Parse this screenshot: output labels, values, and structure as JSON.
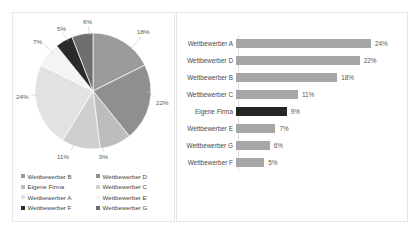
{
  "chart_data": [
    {
      "type": "pie",
      "title": "",
      "categories": [
        "Wettbewerber B",
        "Wettbewerber D",
        "Eigene Firma",
        "Wettbewerber C",
        "Wettbewerber A",
        "Wettbewerber E",
        "Wettbewerber F",
        "Wettbewerber G"
      ],
      "values": [
        18,
        22,
        9,
        11,
        24,
        7,
        5,
        6
      ],
      "labels": [
        "18%",
        "22%",
        "9%",
        "11%",
        "24%",
        "7%",
        "5%",
        "6%"
      ],
      "colors": [
        "#9b9b9b",
        "#8f8f8f",
        "#bdbdbd",
        "#cfcfcf",
        "#e2e2e2",
        "#f4f4f4",
        "#2b2b2b",
        "#6e6e6e"
      ],
      "legend_position": "bottom",
      "legend_columns": 2,
      "legend_order": [
        "Wettbewerber B",
        "Wettbewerber D",
        "Eigene Firma",
        "Wettbewerber C",
        "Wettbewerber A",
        "Wettbewerber E",
        "Wettbewerber F",
        "Wettbewerber G"
      ]
    },
    {
      "type": "bar",
      "orientation": "horizontal",
      "title": "",
      "xlabel": "",
      "ylabel": "",
      "xlim": [
        0,
        24
      ],
      "grid": false,
      "categories": [
        "Wettbewerber A",
        "Wettbewerber D",
        "Wettbewerber B",
        "Wettbewerber C",
        "Eigene Firma",
        "Wettbewerber E",
        "Wettbewerber G",
        "Wettbewerber F"
      ],
      "values": [
        24,
        22,
        18,
        11,
        9,
        7,
        6,
        5
      ],
      "labels": [
        "24%",
        "22%",
        "18%",
        "11%",
        "9%",
        "7%",
        "6%",
        "5%"
      ],
      "highlight_category": "Eigene Firma",
      "bar_color": "#a6a6a6",
      "highlight_color": "#262626"
    }
  ],
  "pie": {
    "slices": [
      {
        "name": "Wettbewerber B",
        "label": "18%",
        "value": 18,
        "color": "#9b9b9b"
      },
      {
        "name": "Wettbewerber D",
        "label": "22%",
        "value": 22,
        "color": "#8f8f8f"
      },
      {
        "name": "Eigene Firma",
        "label": "9%",
        "value": 9,
        "color": "#bdbdbd"
      },
      {
        "name": "Wettbewerber C",
        "label": "11%",
        "value": 11,
        "color": "#cfcfcf"
      },
      {
        "name": "Wettbewerber A",
        "label": "24%",
        "value": 24,
        "color": "#e2e2e2"
      },
      {
        "name": "Wettbewerber E",
        "label": "7%",
        "value": 7,
        "color": "#f4f4f4"
      },
      {
        "name": "Wettbewerber F",
        "label": "5%",
        "value": 5,
        "color": "#2b2b2b"
      },
      {
        "name": "Wettbewerber G",
        "label": "6%",
        "value": 6,
        "color": "#6e6e6e"
      }
    ],
    "legend": [
      {
        "label": "Wettbewerber B",
        "color": "#9b9b9b"
      },
      {
        "label": "Wettbewerber D",
        "color": "#8f8f8f"
      },
      {
        "label": "Eigene Firma",
        "color": "#bdbdbd"
      },
      {
        "label": "Wettbewerber C",
        "color": "#cfcfcf"
      },
      {
        "label": "Wettbewerber A",
        "color": "#e2e2e2"
      },
      {
        "label": "Wettbewerber E",
        "color": "#f4f4f4"
      },
      {
        "label": "Wettbewerber F",
        "color": "#2b2b2b"
      },
      {
        "label": "Wettbewerber G",
        "color": "#6e6e6e"
      }
    ]
  },
  "bars": {
    "rows": [
      {
        "category": "Wettbewerber A",
        "value": 24,
        "label": "24%",
        "highlight": false
      },
      {
        "category": "Wettbewerber D",
        "value": 22,
        "label": "22%",
        "highlight": false
      },
      {
        "category": "Wettbewerber B",
        "value": 18,
        "label": "18%",
        "highlight": false
      },
      {
        "category": "Wettbewerber C",
        "value": 11,
        "label": "11%",
        "highlight": false
      },
      {
        "category": "Eigene Firma",
        "value": 9,
        "label": "9%",
        "highlight": true
      },
      {
        "category": "Wettbewerber E",
        "value": 7,
        "label": "7%",
        "highlight": false
      },
      {
        "category": "Wettbewerber G",
        "value": 6,
        "label": "6%",
        "highlight": false
      },
      {
        "category": "Wettbewerber F",
        "value": 5,
        "label": "5%",
        "highlight": false
      }
    ]
  }
}
